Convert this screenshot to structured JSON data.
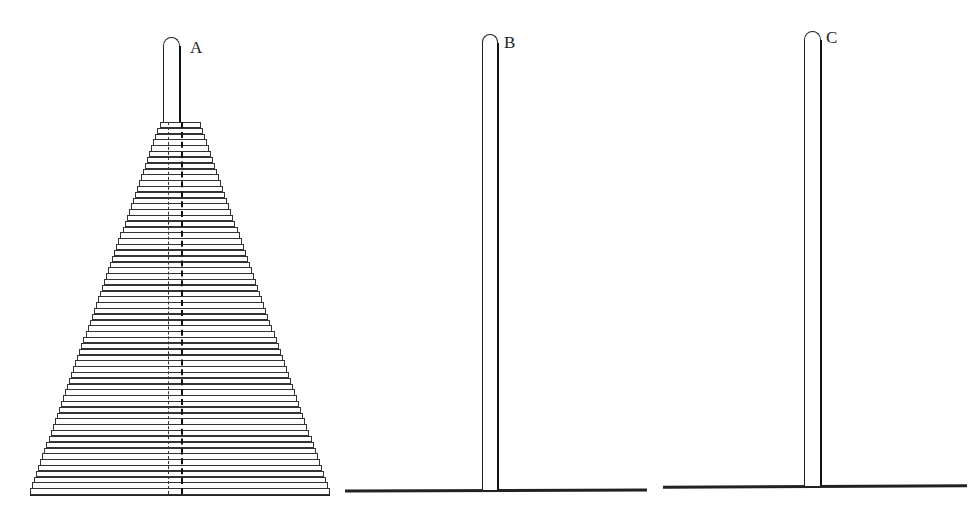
{
  "diagram": {
    "type": "tower-of-hanoi",
    "pegs": [
      {
        "id": "A",
        "label": "A",
        "disk_count": 64
      },
      {
        "id": "B",
        "label": "B",
        "disk_count": 0
      },
      {
        "id": "C",
        "label": "C",
        "disk_count": 0
      }
    ],
    "colors": {
      "line": "#222222",
      "background": "#ffffff"
    }
  }
}
